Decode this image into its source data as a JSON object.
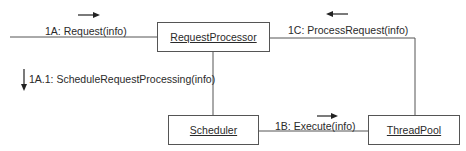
{
  "diagram": {
    "type": "UML collaboration diagram",
    "objects": [
      {
        "id": "rp",
        "name": "RequestProcessor"
      },
      {
        "id": "sch",
        "name": "Scheduler"
      },
      {
        "id": "tp",
        "name": "ThreadPool"
      }
    ],
    "messages": [
      {
        "id": "m1a",
        "label": "1A: Request(info)",
        "direction": "right"
      },
      {
        "id": "m1a1",
        "label": "1A.1: ScheduleRequestProcessing(info)",
        "direction": "down"
      },
      {
        "id": "m1b",
        "label": "1B: Execute(info)",
        "direction": "right"
      },
      {
        "id": "m1c",
        "label": "1C: ProcessRequest(info)",
        "direction": "left"
      }
    ]
  }
}
